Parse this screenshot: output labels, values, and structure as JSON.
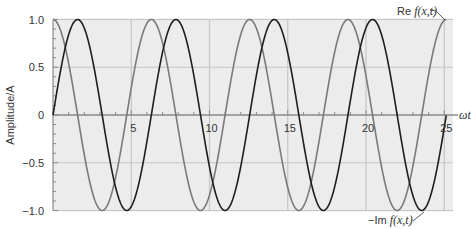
{
  "chart_data": {
    "type": "line",
    "title": "",
    "xlabel": "ωt",
    "ylabel": "Amplitude/A",
    "xlim": [
      0,
      25.6
    ],
    "ylim": [
      -1.0,
      1.0
    ],
    "x_ticks": [
      5,
      10,
      15,
      20,
      25
    ],
    "x_tick_labels": [
      "5",
      "10",
      "15",
      "20",
      "25"
    ],
    "y_ticks": [
      1.0,
      0.5,
      0,
      -0.5,
      -1.0
    ],
    "y_tick_labels": [
      "1.0",
      "0.5",
      "0",
      "−0.5",
      "−1.0"
    ],
    "grid": true,
    "legend": "inline annotations",
    "series": [
      {
        "name": "Re f(x,t)",
        "function": "cos(ωt)",
        "color": "#7a7a7a",
        "x_range": [
          0,
          25.13
        ]
      },
      {
        "name": "−Im f(x,t)",
        "function": "sin(ωt)",
        "color": "#1e1e1e",
        "x_range": [
          0,
          25.13
        ]
      }
    ],
    "annotations": [
      {
        "text_plain": "Re ",
        "text_italic": "f(x,t)",
        "points_to": "Re f(x,t) at ωt≈25.1, y=1.0"
      },
      {
        "text_plain": "−Im ",
        "text_italic": "f(x,t)",
        "points_to": "−Im f(x,t) near ωt≈23.6, y=−1.0"
      }
    ]
  },
  "colors": {
    "plot_bg": "#ececec",
    "grid": "#c6c6c6",
    "axis": "#8a8a8a"
  }
}
